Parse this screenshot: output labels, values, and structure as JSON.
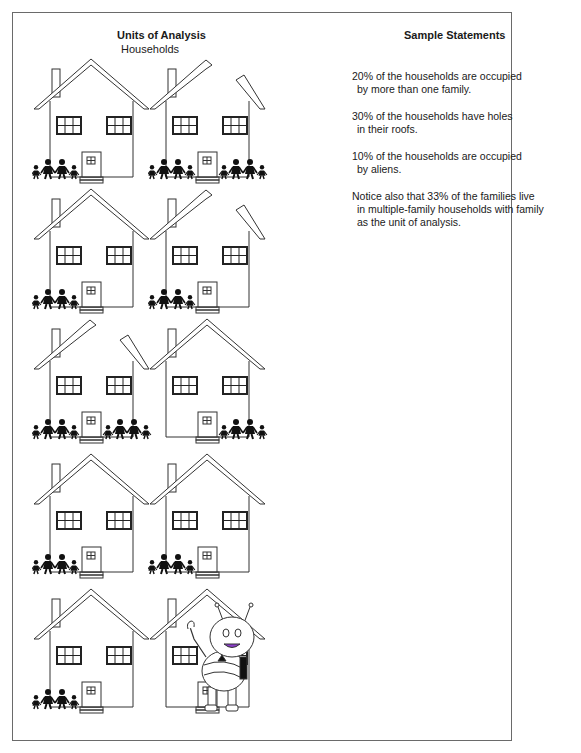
{
  "left_panel": {
    "title": "Units of Analysis",
    "subtitle": "Households"
  },
  "right_panel": {
    "title": "Sample Statements",
    "statements": [
      {
        "line1": "20% of the households are occupied",
        "line2": "by more than one family."
      },
      {
        "line1": "30% of the households have holes",
        "line2": "in their roofs."
      },
      {
        "line1": "10% of the households are occupied",
        "line2": "by aliens."
      },
      {
        "line1": "Notice also that 33% of the families live",
        "line2": "in multiple-family households with family",
        "line3": "as the unit of analysis."
      }
    ]
  },
  "houses": [
    {
      "row": 1,
      "col": 1,
      "families": 1,
      "family_positions": [
        "left"
      ],
      "roof_hole": false,
      "alien": false
    },
    {
      "row": 1,
      "col": 2,
      "families": 2,
      "family_positions": [
        "left",
        "right"
      ],
      "roof_hole": true,
      "alien": false
    },
    {
      "row": 2,
      "col": 1,
      "families": 1,
      "family_positions": [
        "left"
      ],
      "roof_hole": false,
      "alien": false
    },
    {
      "row": 2,
      "col": 2,
      "families": 1,
      "family_positions": [
        "left"
      ],
      "roof_hole": true,
      "alien": false
    },
    {
      "row": 3,
      "col": 1,
      "families": 2,
      "family_positions": [
        "left",
        "right"
      ],
      "roof_hole": true,
      "alien": false
    },
    {
      "row": 3,
      "col": 2,
      "families": 1,
      "family_positions": [
        "right"
      ],
      "roof_hole": false,
      "alien": false
    },
    {
      "row": 4,
      "col": 1,
      "families": 1,
      "family_positions": [
        "left"
      ],
      "roof_hole": false,
      "alien": false
    },
    {
      "row": 4,
      "col": 2,
      "families": 1,
      "family_positions": [
        "left"
      ],
      "roof_hole": false,
      "alien": false
    },
    {
      "row": 5,
      "col": 1,
      "families": 1,
      "family_positions": [
        "left"
      ],
      "roof_hole": false,
      "alien": false
    },
    {
      "row": 5,
      "col": 2,
      "families": 0,
      "family_positions": [],
      "roof_hole": false,
      "alien": true
    }
  ]
}
